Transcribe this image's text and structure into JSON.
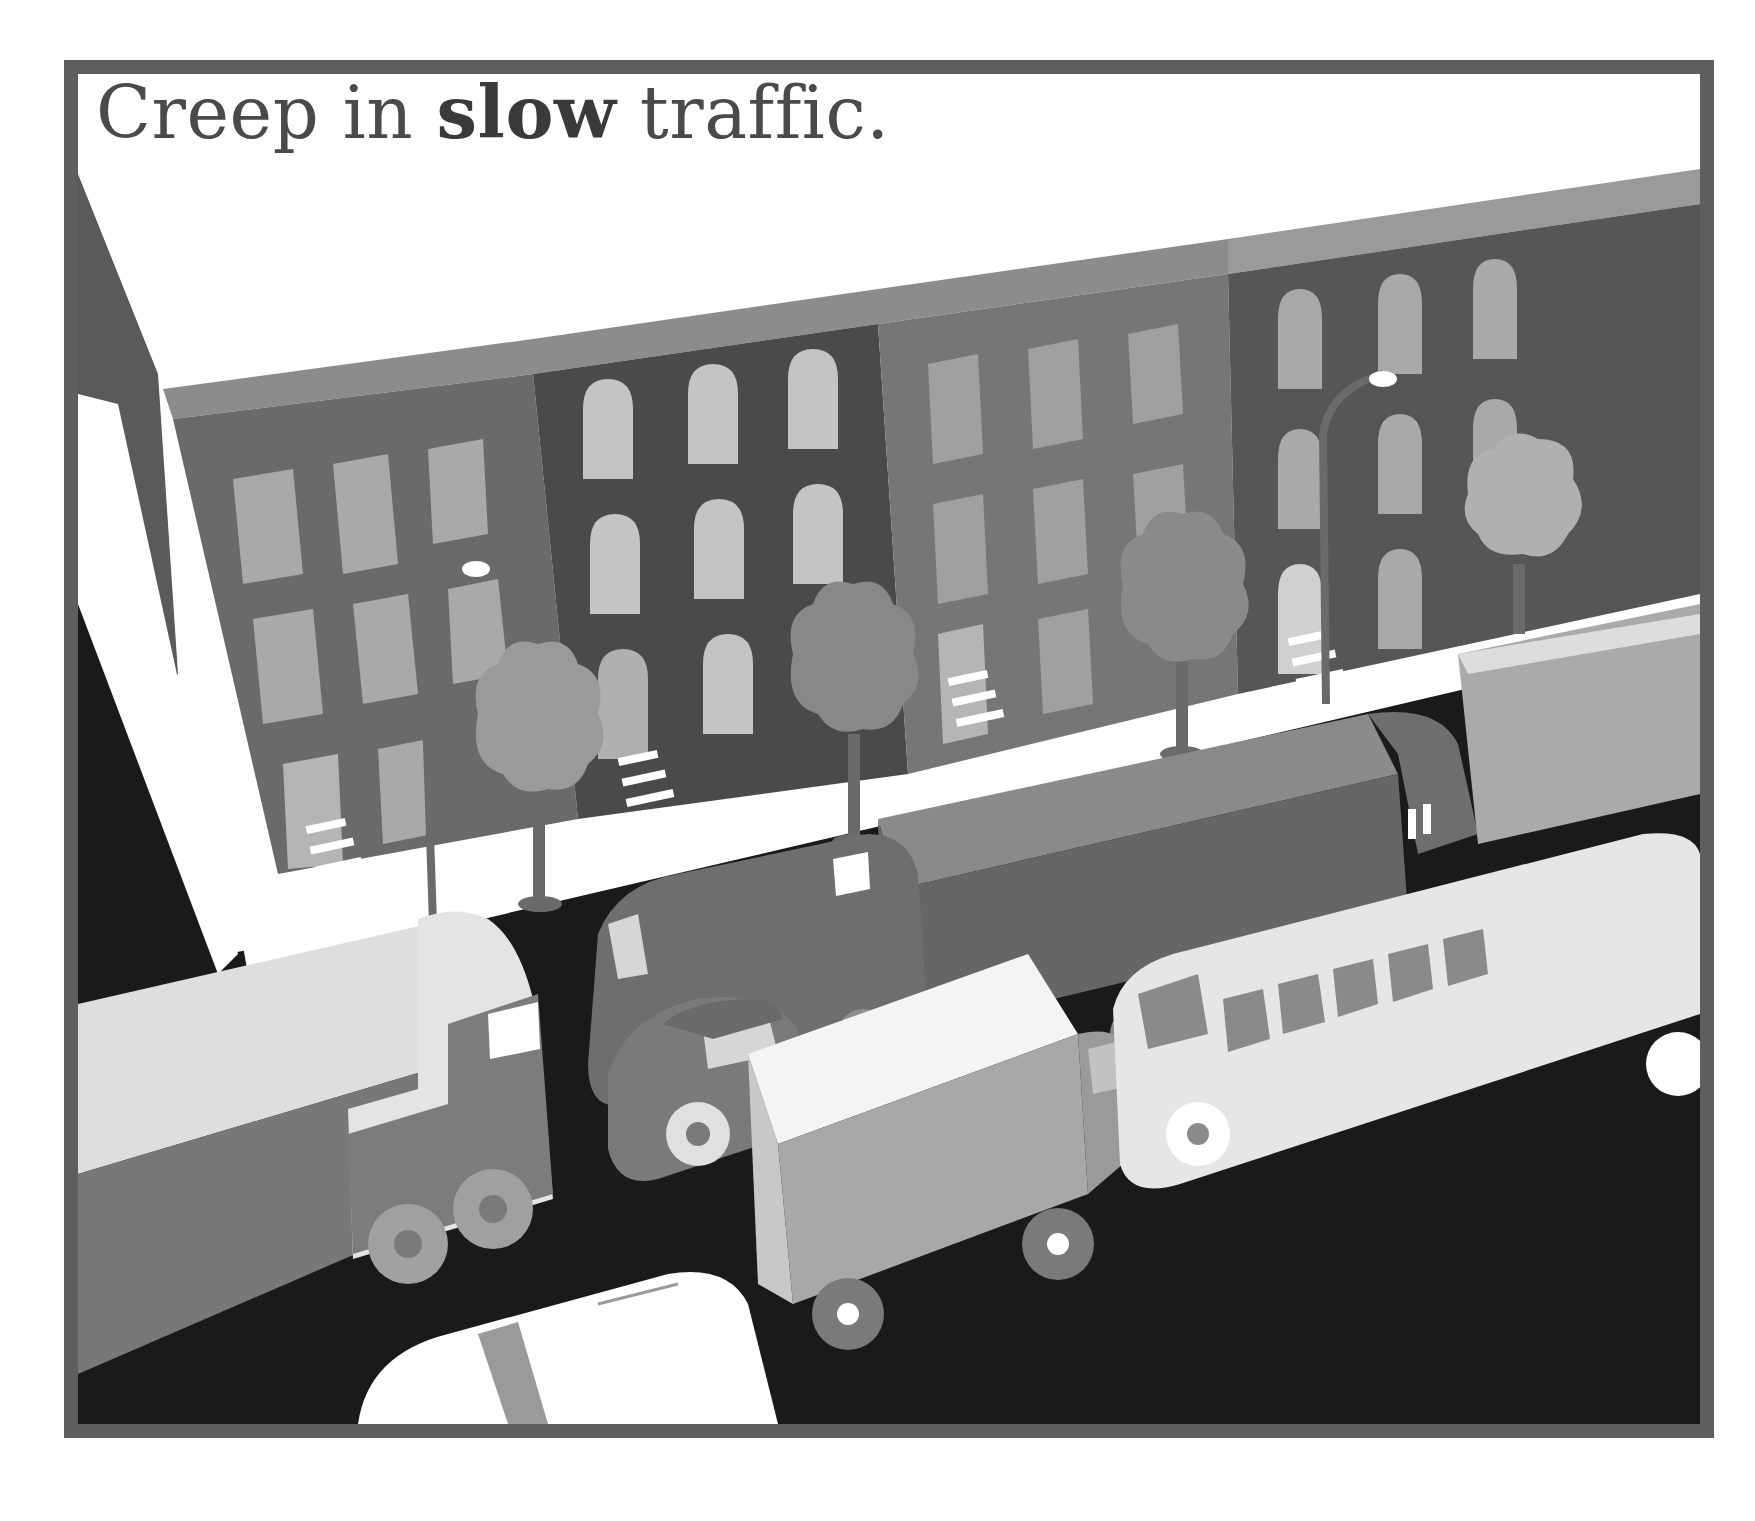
{
  "caption": {
    "before": "Creep in ",
    "emphasis": "slow",
    "after": " traffic."
  },
  "scene": {
    "description": "Illustrated street scene with row houses, street lamps, trees and a traffic jam of trucks, vans, cars and a bus",
    "palette": {
      "frame": "#5e5e5e",
      "sky": "#ffffff",
      "road": "#1a1a1a",
      "sidewalk": "#ffffff",
      "building_a": "#6a6a6a",
      "building_b": "#4a4a4a",
      "building_c": "#767676",
      "building_d": "#565656",
      "cornice": "#8c8c8c",
      "window_light": "#a9a9a9",
      "window_bright": "#c4c4c4",
      "tree": "#9a9a9a",
      "truck_box": "#dcdcdc",
      "truck_body": "#7a7a7a",
      "bus": "#e6e6e6",
      "wheel": "#8a8a8a"
    },
    "buildings": [
      {
        "name": "rowhouse-1",
        "window_style": "rectangular"
      },
      {
        "name": "rowhouse-2",
        "window_style": "arched"
      },
      {
        "name": "rowhouse-3",
        "window_style": "rectangular"
      },
      {
        "name": "rowhouse-4",
        "window_style": "arched"
      }
    ],
    "vehicles": [
      {
        "name": "large-truck-left"
      },
      {
        "name": "delivery-van"
      },
      {
        "name": "box-truck-center"
      },
      {
        "name": "small-car"
      },
      {
        "name": "box-van-front"
      },
      {
        "name": "minibus"
      },
      {
        "name": "truck-right"
      },
      {
        "name": "car-bottom"
      }
    ]
  }
}
